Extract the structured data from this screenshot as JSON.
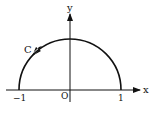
{
  "diagram": {
    "type": "semicircle-contour",
    "labels": {
      "x_axis": "x",
      "y_axis": "y",
      "origin": "O",
      "curve": "C",
      "left_tick": "−1",
      "right_tick": "1"
    },
    "curve": {
      "shape": "upper semicircle",
      "center": [
        0,
        0
      ],
      "radius": 1,
      "direction": "counterclockwise"
    },
    "colors": {
      "stroke": "#111111",
      "background": "#ffffff"
    }
  }
}
